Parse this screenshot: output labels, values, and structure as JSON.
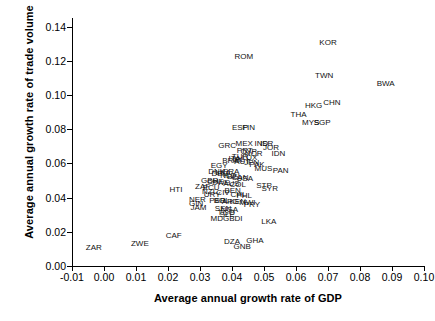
{
  "chart_data": {
    "type": "scatter",
    "title": "",
    "xlabel": "Average annual growth rate of GDP",
    "ylabel": "Average annual growth rate of trade volume",
    "xlim": [
      -0.01,
      0.1
    ],
    "ylim": [
      0.0,
      0.145
    ],
    "xticks": [
      "-0.01",
      "0.00",
      "0.01",
      "0.02",
      "0.03",
      "0.04",
      "0.05",
      "0.06",
      "0.07",
      "0.08",
      "0.09",
      "0.10"
    ],
    "xtick_values": [
      -0.01,
      0.0,
      0.01,
      0.02,
      0.03,
      0.04,
      0.05,
      0.06,
      0.07,
      0.08,
      0.09,
      0.1
    ],
    "yticks": [
      "0.00",
      "0.02",
      "0.04",
      "0.06",
      "0.08",
      "0.10",
      "0.12",
      "0.14"
    ],
    "ytick_values": [
      0.0,
      0.02,
      0.04,
      0.06,
      0.08,
      0.1,
      0.12,
      0.14
    ],
    "grid": false,
    "legend": false,
    "marker_style": "text-label",
    "points": [
      {
        "label": "KOR",
        "x": 0.07,
        "y": 0.1305
      },
      {
        "label": "ROM",
        "x": 0.0437,
        "y": 0.1222
      },
      {
        "label": "TWN",
        "x": 0.0688,
        "y": 0.1108
      },
      {
        "label": "BWA",
        "x": 0.088,
        "y": 0.1062
      },
      {
        "label": "CHN",
        "x": 0.0712,
        "y": 0.0952
      },
      {
        "label": "HKG",
        "x": 0.0655,
        "y": 0.0938
      },
      {
        "label": "THA",
        "x": 0.0608,
        "y": 0.0882
      },
      {
        "label": "MYS",
        "x": 0.0646,
        "y": 0.0838
      },
      {
        "label": "SGP",
        "x": 0.0682,
        "y": 0.0835
      },
      {
        "label": "ESP",
        "x": 0.0425,
        "y": 0.0805
      },
      {
        "label": "FIN",
        "x": 0.0452,
        "y": 0.0805
      },
      {
        "label": "MEX",
        "x": 0.0438,
        "y": 0.0715
      },
      {
        "label": "IND",
        "x": 0.0492,
        "y": 0.0712
      },
      {
        "label": "ISR",
        "x": 0.0508,
        "y": 0.0712
      },
      {
        "label": "GRC",
        "x": 0.0385,
        "y": 0.07
      },
      {
        "label": "JOR",
        "x": 0.0522,
        "y": 0.0688
      },
      {
        "label": "PRT",
        "x": 0.044,
        "y": 0.0672
      },
      {
        "label": "CYP",
        "x": 0.0452,
        "y": 0.0665
      },
      {
        "label": "NOR",
        "x": 0.0468,
        "y": 0.0655
      },
      {
        "label": "IDN",
        "x": 0.0545,
        "y": 0.0652
      },
      {
        "label": "TUR",
        "x": 0.0425,
        "y": 0.064
      },
      {
        "label": "LUX",
        "x": 0.0455,
        "y": 0.0632
      },
      {
        "label": "ITA",
        "x": 0.0408,
        "y": 0.0628
      },
      {
        "label": "IRL",
        "x": 0.042,
        "y": 0.0622
      },
      {
        "label": "BRA",
        "x": 0.0395,
        "y": 0.0615
      },
      {
        "label": "AUT",
        "x": 0.0432,
        "y": 0.0608
      },
      {
        "label": "JPN",
        "x": 0.0462,
        "y": 0.0602
      },
      {
        "label": "PAK",
        "x": 0.0478,
        "y": 0.0588
      },
      {
        "label": "EGY",
        "x": 0.036,
        "y": 0.0582
      },
      {
        "label": "MUS",
        "x": 0.0498,
        "y": 0.0565
      },
      {
        "label": "PAN",
        "x": 0.0552,
        "y": 0.0558
      },
      {
        "label": "FRA",
        "x": 0.0398,
        "y": 0.0552
      },
      {
        "label": "DNK",
        "x": 0.0352,
        "y": 0.0548
      },
      {
        "label": "LKA2",
        "x": 0.0372,
        "y": 0.0542
      },
      {
        "label": "DEU",
        "x": 0.0362,
        "y": 0.0535
      },
      {
        "label": "NLD",
        "x": 0.0388,
        "y": 0.0528
      },
      {
        "label": "BEL",
        "x": 0.0408,
        "y": 0.0522
      },
      {
        "label": "CAN",
        "x": 0.0425,
        "y": 0.0515
      },
      {
        "label": "USA",
        "x": 0.044,
        "y": 0.0508
      },
      {
        "label": "GBR",
        "x": 0.033,
        "y": 0.0498
      },
      {
        "label": "CHE",
        "x": 0.0348,
        "y": 0.0492
      },
      {
        "label": "SWE",
        "x": 0.0365,
        "y": 0.0488
      },
      {
        "label": "AUS",
        "x": 0.0398,
        "y": 0.0478
      },
      {
        "label": "COL",
        "x": 0.0418,
        "y": 0.0472
      },
      {
        "label": "STP",
        "x": 0.05,
        "y": 0.0468
      },
      {
        "label": "SYR",
        "x": 0.0518,
        "y": 0.0452
      },
      {
        "label": "ZAF",
        "x": 0.0308,
        "y": 0.0462
      },
      {
        "label": "ECU",
        "x": 0.0335,
        "y": 0.0455
      },
      {
        "label": "NZL",
        "x": 0.033,
        "y": 0.0432
      },
      {
        "label": "BEN",
        "x": 0.0402,
        "y": 0.0438
      },
      {
        "label": "CIV",
        "x": 0.0372,
        "y": 0.0428
      },
      {
        "label": "URY",
        "x": 0.0338,
        "y": 0.0418
      },
      {
        "label": "CHL",
        "x": 0.042,
        "y": 0.0415
      },
      {
        "label": "PHL",
        "x": 0.0438,
        "y": 0.0408
      },
      {
        "label": "NER",
        "x": 0.0292,
        "y": 0.0385
      },
      {
        "label": "GIN",
        "x": 0.0288,
        "y": 0.0362
      },
      {
        "label": "JAM",
        "x": 0.0295,
        "y": 0.0342
      },
      {
        "label": "PER",
        "x": 0.0355,
        "y": 0.0382
      },
      {
        "label": "BOL",
        "x": 0.0368,
        "y": 0.0378
      },
      {
        "label": "ARG",
        "x": 0.0395,
        "y": 0.0375
      },
      {
        "label": "KEN",
        "x": 0.0418,
        "y": 0.0372
      },
      {
        "label": "MWI",
        "x": 0.0448,
        "y": 0.0368
      },
      {
        "label": "PRY",
        "x": 0.0462,
        "y": 0.0358
      },
      {
        "label": "SEN",
        "x": 0.0372,
        "y": 0.0335
      },
      {
        "label": "NGA",
        "x": 0.0392,
        "y": 0.033
      },
      {
        "label": "TGO",
        "x": 0.0382,
        "y": 0.0312
      },
      {
        "label": "SLE",
        "x": 0.0385,
        "y": 0.03
      },
      {
        "label": "MDG",
        "x": 0.0362,
        "y": 0.0272
      },
      {
        "label": "BDI",
        "x": 0.0412,
        "y": 0.0272
      },
      {
        "label": "LKA",
        "x": 0.0515,
        "y": 0.0258
      },
      {
        "label": "HTI",
        "x": 0.0225,
        "y": 0.0442
      },
      {
        "label": "CAF",
        "x": 0.0218,
        "y": 0.0178
      },
      {
        "label": "ZWE",
        "x": 0.0112,
        "y": 0.013
      },
      {
        "label": "ZAR",
        "x": -0.0032,
        "y": 0.0108
      },
      {
        "label": "DZA",
        "x": 0.04,
        "y": 0.014
      },
      {
        "label": "GHA",
        "x": 0.0472,
        "y": 0.0145
      },
      {
        "label": "GNB",
        "x": 0.0432,
        "y": 0.0112
      }
    ]
  }
}
